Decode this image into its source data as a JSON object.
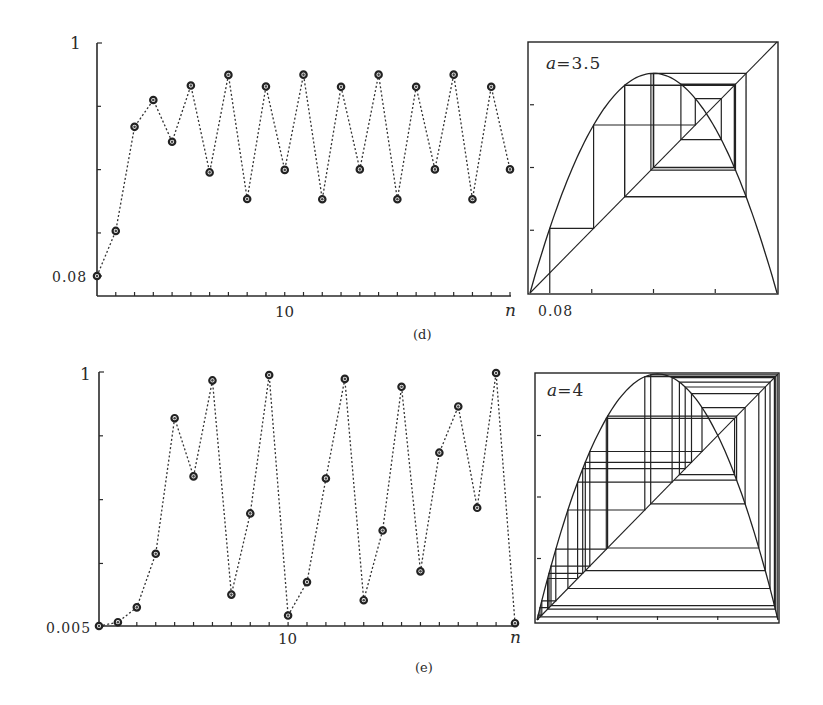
{
  "figure": {
    "panels": [
      {
        "id": "d",
        "caption": "(d)"
      },
      {
        "id": "e",
        "caption": "(e)"
      }
    ]
  },
  "chart_data": [
    {
      "type": "line",
      "panel": "(d)",
      "title": "",
      "xlabel": "n",
      "ylabel": "",
      "x": [
        0,
        1,
        2,
        3,
        4,
        5,
        6,
        7,
        8,
        9,
        10,
        11,
        12,
        13,
        14,
        15,
        16,
        17,
        18,
        19,
        20,
        21,
        22
      ],
      "values": [
        0.08,
        0.258,
        0.669,
        0.775,
        0.61,
        0.832,
        0.489,
        0.874,
        0.384,
        0.828,
        0.499,
        0.875,
        0.383,
        0.827,
        0.501,
        0.875,
        0.383,
        0.827,
        0.501,
        0.875,
        0.383,
        0.827,
        0.501
      ],
      "ylim": [
        0.08,
        1
      ],
      "y_tick_labels": [
        "0.08",
        "1"
      ],
      "y_ticks": [
        0.25,
        0.5,
        0.75
      ],
      "x_tick_labels": [
        "10"
      ],
      "x_tick_every": 1,
      "xlim": [
        0,
        22
      ],
      "markers": "circle",
      "linestyle": "dotted",
      "grid": false
    },
    {
      "type": "line",
      "panel": "(d) cobweb",
      "title": "",
      "annotation": "a=3.5",
      "a": 3.5,
      "x0": 0.08,
      "iterations": 22,
      "x_tick_labels": [
        "0.08"
      ],
      "xlim": [
        0,
        1
      ],
      "ylim": [
        0,
        1
      ],
      "ticks": [
        0.25,
        0.5,
        0.75
      ],
      "curves": [
        "y = a x (1 - x)",
        "y = x"
      ],
      "grid": false
    },
    {
      "type": "line",
      "panel": "(e)",
      "title": "",
      "xlabel": "n",
      "ylabel": "",
      "x": [
        0,
        1,
        2,
        3,
        4,
        5,
        6,
        7,
        8,
        9,
        10,
        11,
        12,
        13,
        14,
        15,
        16,
        17,
        18,
        19,
        20,
        21,
        22
      ],
      "values": [
        0.005,
        0.0199,
        0.078,
        0.288,
        0.819,
        0.591,
        0.967,
        0.128,
        0.446,
        0.988,
        0.046,
        0.177,
        0.583,
        0.973,
        0.106,
        0.379,
        0.942,
        0.219,
        0.684,
        0.865,
        0.468,
        0.996,
        0.016
      ],
      "ylim": [
        0.005,
        1
      ],
      "y_tick_labels": [
        "0.005",
        "1"
      ],
      "y_ticks": [
        0.25,
        0.5,
        0.75
      ],
      "x_tick_labels": [
        "10"
      ],
      "x_tick_every": 1,
      "xlim": [
        0,
        22
      ],
      "markers": "circle",
      "linestyle": "dotted",
      "grid": false
    },
    {
      "type": "line",
      "panel": "(e) cobweb",
      "title": "",
      "annotation": "a=4",
      "a": 4,
      "x0": 0.005,
      "iterations": 30,
      "xlim": [
        0,
        1
      ],
      "ylim": [
        0,
        1
      ],
      "ticks": [
        0.25,
        0.5,
        0.75
      ],
      "curves": [
        "y = a x (1 - x)",
        "y = x"
      ],
      "grid": false
    }
  ],
  "labels": {
    "d": {
      "y_top": "1",
      "y_bottom": "0.08",
      "x_mid": "10",
      "x_axis": "n",
      "caption": "(d)",
      "cob_annot_var": "a",
      "cob_annot_val": "=3.5",
      "cob_x_label": "0.08"
    },
    "e": {
      "y_top": "1",
      "y_bottom": "0.005",
      "x_mid": "10",
      "x_axis": "n",
      "caption": "(e)",
      "cob_annot_var": "a",
      "cob_annot_val": "=4"
    }
  }
}
